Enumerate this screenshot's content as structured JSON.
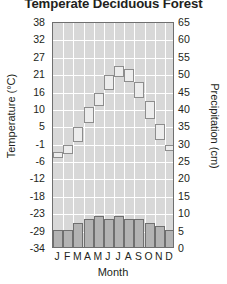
{
  "chart_data": {
    "type": "bar",
    "title": "Temperate Deciduous Forest",
    "xlabel": "Month",
    "ylabel": "Temperature (°C)",
    "y2label": "Precipitation (cm)",
    "grid": true,
    "legend": "none",
    "categories": [
      "J",
      "F",
      "M",
      "A",
      "M",
      "J",
      "J",
      "A",
      "S",
      "O",
      "N",
      "D"
    ],
    "month_names": [
      "January",
      "February",
      "March",
      "April",
      "May",
      "June",
      "July",
      "August",
      "September",
      "October",
      "November",
      "December"
    ],
    "ylim": [
      -34,
      38
    ],
    "y2lim": [
      0,
      65
    ],
    "yticks": [
      38,
      32,
      27,
      21,
      16,
      10,
      5,
      -1,
      -6,
      -12,
      -18,
      -23,
      -29,
      -34
    ],
    "y2ticks": [
      65,
      60,
      55,
      50,
      45,
      40,
      35,
      30,
      25,
      20,
      15,
      10,
      5,
      0
    ],
    "series": [
      {
        "name": "Temperature",
        "unit": "°C",
        "axis": "left",
        "style": "step-blocks",
        "values": [
          -3,
          -1,
          5,
          11,
          16,
          21,
          24,
          23,
          19,
          13,
          6,
          -1
        ]
      },
      {
        "name": "Precipitation",
        "unit": "cm",
        "axis": "right",
        "style": "bars",
        "values": [
          5,
          5,
          7,
          8,
          9,
          8,
          9,
          8,
          8,
          7,
          6,
          5
        ]
      }
    ]
  }
}
